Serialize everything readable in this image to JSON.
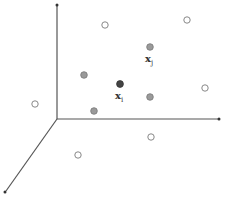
{
  "diagram": {
    "type": "3d-scatter-schematic",
    "axes": {
      "origin": [
        57,
        119
      ],
      "vertical_end": [
        57,
        5
      ],
      "horizontal_end": [
        219,
        119
      ],
      "depth_end": [
        5,
        192
      ],
      "color": "#555555"
    },
    "points": {
      "open": [
        [
          105,
          25
        ],
        [
          187,
          20
        ],
        [
          35,
          104
        ],
        [
          205,
          88
        ],
        [
          78,
          155
        ],
        [
          151,
          137
        ]
      ],
      "gray": [
        [
          84,
          75
        ],
        [
          150,
          47
        ],
        [
          150,
          97
        ],
        [
          94,
          111
        ]
      ],
      "dark": [
        [
          120,
          84
        ]
      ]
    },
    "colors": {
      "open_stroke": "#888888",
      "gray_fill": "#999999",
      "dark_fill": "#444444"
    },
    "labels": {
      "xi": {
        "main": "x",
        "sub": "i"
      },
      "xj": {
        "main": "x",
        "sub": "j"
      }
    }
  }
}
